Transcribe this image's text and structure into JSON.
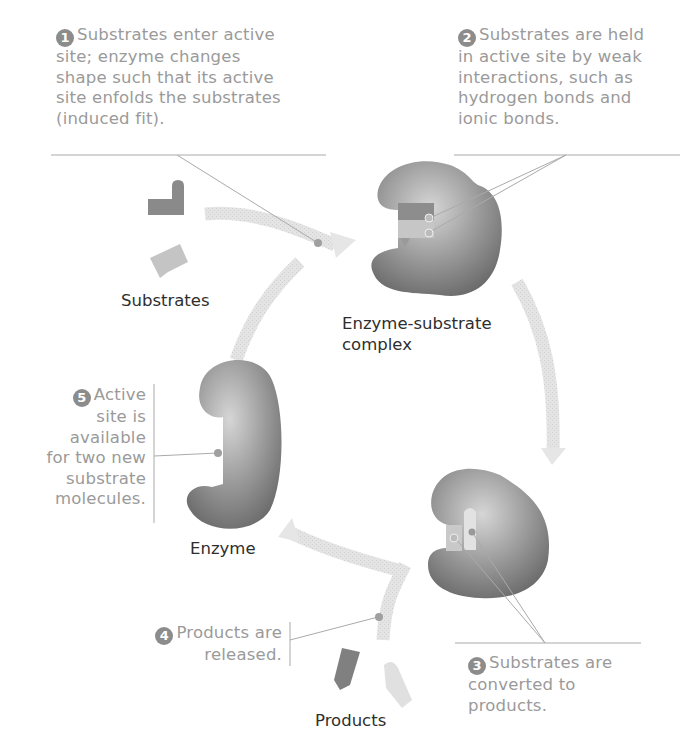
{
  "diagram": {
    "type": "enzyme catalytic cycle",
    "steps": [
      {
        "number": "1",
        "text_lines": [
          "Substrates enter active",
          "site; enzyme changes",
          "shape such that its active",
          "site enfolds the  substrates",
          "(induced fit)."
        ]
      },
      {
        "number": "2",
        "text_lines": [
          "Substrates are held",
          "in active site by weak",
          "interactions, such as",
          "hydrogen bonds and",
          "ionic bonds."
        ]
      },
      {
        "number": "3",
        "text_lines": [
          "Substrates are",
          "converted to",
          "products."
        ]
      },
      {
        "number": "4",
        "text_lines": [
          "Products are",
          "released."
        ]
      },
      {
        "number": "5",
        "text_lines": [
          "Active",
          "site is",
          "available",
          "for two new",
          "substrate",
          "molecules."
        ]
      }
    ],
    "labels": {
      "substrates": "Substrates",
      "complex_line1": "Enzyme-substrate",
      "complex_line2": "complex",
      "enzyme": "Enzyme",
      "products": "Products"
    },
    "colors": {
      "annotation_text": "#9a9a9a",
      "label_text": "#2e2e2e",
      "enzyme": "#7d7d7d",
      "arrow": "#e0e0e0",
      "leader_line": "#aaaaaa"
    }
  }
}
